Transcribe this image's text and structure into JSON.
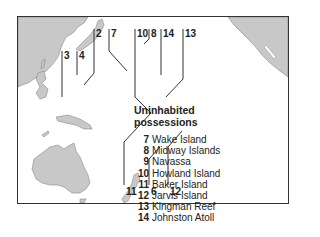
{
  "map": {
    "title": "Uninhabited possessions",
    "title_lines": [
      "Uninhabited",
      "possessions"
    ],
    "land_color": "#c8c8c8",
    "line_color": "#333333",
    "callout_labels": [
      {
        "id": "2",
        "text": "2"
      },
      {
        "id": "3",
        "text": "3"
      },
      {
        "id": "4",
        "text": "4"
      },
      {
        "id": "6",
        "text": "6"
      },
      {
        "id": "7",
        "text": "7"
      },
      {
        "id": "8",
        "text": "8"
      },
      {
        "id": "10",
        "text": "10"
      },
      {
        "id": "11",
        "text": "11"
      },
      {
        "id": "12",
        "text": "12"
      },
      {
        "id": "13",
        "text": "13"
      },
      {
        "id": "14",
        "text": "14"
      }
    ],
    "legend": [
      {
        "num": "7",
        "name": "Wake Island"
      },
      {
        "num": "8",
        "name": "Midway Islands"
      },
      {
        "num": "9",
        "name": "Navassa"
      },
      {
        "num": "10",
        "name": "Howland Island"
      },
      {
        "num": "11",
        "name": "Baker Island"
      },
      {
        "num": "12",
        "name": "Jarvis Island"
      },
      {
        "num": "13",
        "name": "Kingman Reef"
      },
      {
        "num": "14",
        "name": "Johnston Atoll"
      }
    ]
  }
}
